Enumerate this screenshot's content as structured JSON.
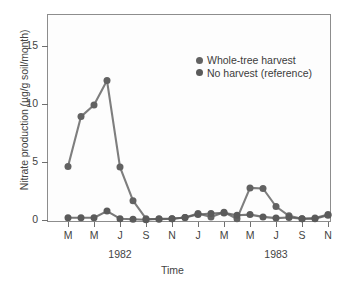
{
  "chart_data": {
    "type": "line",
    "title": "",
    "xlabel": "Time",
    "ylabel": "Nitrate production (µg/g soil/month)",
    "ylim": [
      0,
      17.5
    ],
    "yticks": [
      0,
      5,
      10,
      15
    ],
    "ytick_labels": [
      "0",
      "5",
      "10",
      "15"
    ],
    "grid": false,
    "legend_position": "upper right",
    "x_tick_labels": [
      "M",
      "M",
      "J",
      "S",
      "N",
      "J",
      "M",
      "M",
      "J",
      "S",
      "N"
    ],
    "x_group_labels": [
      "1982",
      "1983"
    ],
    "x": [
      "M",
      "A",
      "M",
      "J",
      "J",
      "A",
      "S",
      "O",
      "N",
      "D",
      "J",
      "F",
      "M",
      "A",
      "M",
      "J",
      "J",
      "A",
      "S",
      "O",
      "N"
    ],
    "series": [
      {
        "name": "Whole-tree harvest",
        "color": "#626262",
        "marker": "circle",
        "values": [
          4.7,
          9.0,
          10.0,
          12.1,
          4.65,
          1.75,
          0.2,
          0.15,
          0.2,
          0.3,
          0.65,
          0.35,
          0.75,
          0.2,
          2.85,
          2.8,
          1.25,
          0.45,
          0.2,
          0.25,
          0.55
        ]
      },
      {
        "name": "No harvest (reference)",
        "color": "#5a5a5a",
        "marker": "circle",
        "values": [
          0.28,
          0.28,
          0.28,
          0.85,
          0.2,
          0.15,
          0.1,
          0.2,
          0.2,
          0.3,
          0.55,
          0.65,
          0.7,
          0.5,
          0.55,
          0.35,
          0.25,
          0.3,
          0.2,
          0.2,
          0.5
        ]
      }
    ]
  },
  "legend": {
    "items": [
      {
        "label": "Whole-tree harvest",
        "color": "#626262"
      },
      {
        "label": "No harvest (reference)",
        "color": "#5a5a5a"
      }
    ]
  },
  "axes": {
    "y_title": "Nitrate production (µg/g soil/month)",
    "x_title": "Time",
    "y_tick_labels": [
      "15",
      "10",
      "5",
      "0"
    ],
    "x_tick_labels": [
      "M",
      "M",
      "J",
      "S",
      "N",
      "J",
      "M",
      "M",
      "J",
      "S",
      "N"
    ],
    "year_1982": "1982",
    "year_1983": "1983"
  }
}
